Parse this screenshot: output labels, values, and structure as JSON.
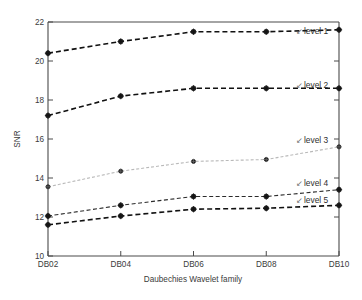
{
  "chart_data": {
    "type": "line",
    "title": "",
    "xlabel": "Daubechies Wavelet family",
    "ylabel": "SNR",
    "categories": [
      "DB02",
      "DB04",
      "DB06",
      "DB08",
      "DB10"
    ],
    "xticklabels": [
      "DB02",
      "DB04",
      "DB06",
      "DB08",
      "DB10"
    ],
    "yticklabels": [
      "10",
      "12",
      "14",
      "16",
      "18",
      "20",
      "22"
    ],
    "ytickvalues": [
      10,
      12,
      14,
      16,
      18,
      20,
      22
    ],
    "ylim": [
      10,
      22
    ],
    "xlim": [
      0,
      4
    ],
    "grid": false,
    "legend_position": "inline-right-annotations",
    "series": [
      {
        "name": "level 1",
        "label": "level 1",
        "values": [
          20.4,
          21.0,
          21.5,
          21.5,
          21.6
        ],
        "color": "#111111",
        "dash": "5,3",
        "width": 1.6
      },
      {
        "name": "level 2",
        "label": "level 2",
        "values": [
          17.2,
          18.2,
          18.6,
          18.6,
          18.6
        ],
        "color": "#111111",
        "dash": "5,3",
        "width": 1.6
      },
      {
        "name": "level 3",
        "label": "level 3",
        "values": [
          13.55,
          14.35,
          14.85,
          14.95,
          15.6
        ],
        "color": "#b9b9b9",
        "dash": "3,2",
        "width": 1.1
      },
      {
        "name": "level 4",
        "label": "level 4",
        "values": [
          12.05,
          12.6,
          13.05,
          13.05,
          13.4
        ],
        "color": "#2b2b2b",
        "dash": "4,2.5",
        "width": 1.1
      },
      {
        "name": "level 5",
        "label": "level 5",
        "values": [
          11.6,
          12.05,
          12.4,
          12.45,
          12.6
        ],
        "color": "#111111",
        "dash": "5,3",
        "width": 1.6
      }
    ],
    "annotations": [
      {
        "text": "level 1",
        "arrow": "↙",
        "y_value": 21.5
      },
      {
        "text": "level 2",
        "arrow": "↙",
        "y_value": 18.7
      },
      {
        "text": "level 3",
        "arrow": "↙",
        "y_value": 15.9
      },
      {
        "text": "level 4",
        "arrow": "↙",
        "y_value": 13.7
      },
      {
        "text": "level 5",
        "arrow": "↙",
        "y_value": 12.8
      }
    ],
    "colors": {
      "axis": "#4a4a4a",
      "text": "#3b3b3b",
      "marker": "#1a1a1a",
      "background": "#ffffff"
    }
  }
}
